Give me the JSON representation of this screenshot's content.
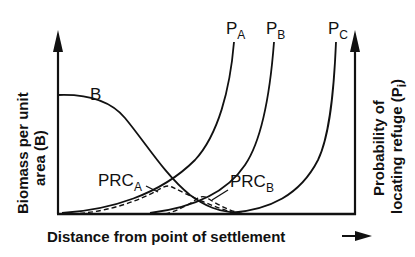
{
  "diagram": {
    "x_axis_label": "Distance from point of settlement",
    "left_axis_label_line1": "Biomass per unit",
    "left_axis_label_line2": "area (B)",
    "right_axis_label_line1": "Probability of",
    "right_axis_label_line2": "locating refuge (P",
    "right_axis_label_sub": "i",
    "right_axis_label_close": ")",
    "curves": {
      "B": {
        "label": "B",
        "style": "solid",
        "description": "biomass decreasing sigmoidally with distance"
      },
      "PA": {
        "label": "P",
        "sub": "A",
        "style": "solid"
      },
      "PB": {
        "label": "P",
        "sub": "B",
        "style": "solid"
      },
      "PC": {
        "label": "P",
        "sub": "C",
        "style": "solid"
      },
      "PRCA": {
        "label": "PRC",
        "sub": "A",
        "style": "dashed"
      },
      "PRCB": {
        "label": "PRC",
        "sub": "B",
        "style": "dashed"
      }
    },
    "colors": {
      "line": "#111111",
      "background": "#ffffff"
    }
  }
}
